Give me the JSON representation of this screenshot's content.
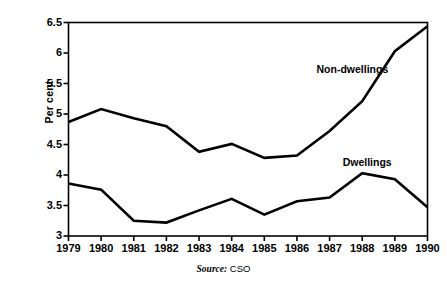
{
  "chart_data": {
    "type": "line",
    "title": "",
    "xlabel": "",
    "ylabel": "Per cent",
    "categories": [
      "1979",
      "1980",
      "1981",
      "1982",
      "1983",
      "1984",
      "1985",
      "1986",
      "1987",
      "1988",
      "1989",
      "1990"
    ],
    "x": [
      1979,
      1980,
      1981,
      1982,
      1983,
      1984,
      1985,
      1986,
      1987,
      1988,
      1989,
      1990
    ],
    "series": [
      {
        "name": "Non-dwellings",
        "values": [
          4.87,
          5.08,
          4.93,
          4.8,
          4.38,
          4.51,
          4.28,
          4.32,
          4.72,
          5.21,
          6.03,
          6.44
        ],
        "color": "#000000"
      },
      {
        "name": "Dwellings",
        "values": [
          3.86,
          3.76,
          3.25,
          3.22,
          3.42,
          3.61,
          3.35,
          3.57,
          3.63,
          4.03,
          3.93,
          3.47
        ],
        "color": "#000000"
      }
    ],
    "ylim": [
      3,
      6.5
    ],
    "yticks": [
      3,
      3.5,
      4,
      4.5,
      5,
      5.5,
      6,
      6.5
    ],
    "ytick_labels": [
      "3",
      "3.5",
      "4",
      "4.5",
      "5",
      "5.5",
      "6",
      "6.5"
    ],
    "grid": false,
    "legend": "inline-annotations",
    "annotations": [
      {
        "text": "Non-dwellings",
        "x": 1986.6,
        "y": 5.72
      },
      {
        "text": "Dwellings",
        "x": 1987.4,
        "y": 4.2
      }
    ]
  },
  "source": {
    "label": "Source:",
    "value": "CSO"
  }
}
